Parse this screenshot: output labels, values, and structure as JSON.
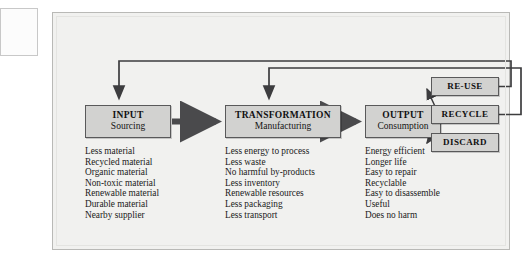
{
  "diagram": {
    "title_hidden": "",
    "stages": [
      {
        "id": "input",
        "heading": "INPUT",
        "subheading": "Sourcing",
        "items": [
          "Less material",
          "Recycled material",
          "Organic material",
          "Non-toxic material",
          "Renewable material",
          "Durable material",
          "Nearby supplier"
        ]
      },
      {
        "id": "transformation",
        "heading": "TRANSFORMATION",
        "subheading": "Manufacturing",
        "items": [
          "Less energy to process",
          "Less waste",
          "No harmful by-products",
          "Less inventory",
          "Renewable resources",
          "Less packaging",
          "Less transport"
        ]
      },
      {
        "id": "output",
        "heading": "OUTPUT",
        "subheading": "Consumption",
        "items": [
          "Energy efficient",
          "Longer life",
          "Easy to repair",
          "Recyclable",
          "Easy to disassemble",
          "Useful",
          "Does no harm"
        ]
      }
    ],
    "endpoints": [
      {
        "id": "reuse",
        "label": "RE-USE"
      },
      {
        "id": "recycle",
        "label": "RECYCLE"
      },
      {
        "id": "discard",
        "label": "DISCARD"
      }
    ],
    "colors": {
      "box_fill": "#d2d2d0",
      "box_stroke": "#59595a",
      "panel_bg": "#f1f1ef",
      "arrow": "#4a4a4c",
      "text": "#101010"
    }
  }
}
